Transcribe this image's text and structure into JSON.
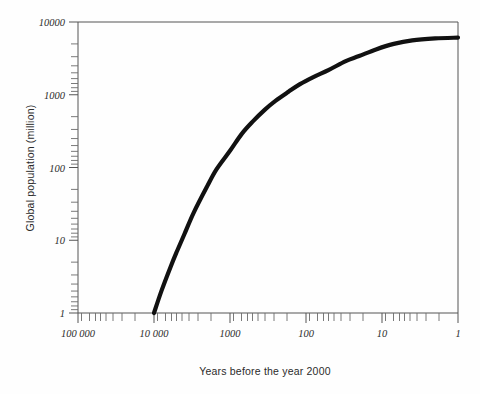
{
  "figure": {
    "background_color": "#fefefe",
    "curve_color": "#111111",
    "axis_color": "#555555"
  },
  "chart_data": {
    "type": "line",
    "title": "",
    "xlabel": "Years before the year 2000",
    "ylabel": "Global population (million)",
    "xscale": "log",
    "yscale": "log",
    "x_reversed": true,
    "xlim": [
      100000,
      1
    ],
    "ylim": [
      1,
      10000
    ],
    "grid": false,
    "legend": "none",
    "x_tick_labels": [
      "100 000",
      "10 000",
      "1000",
      "100",
      "10",
      "1"
    ],
    "x_tick_values": [
      100000,
      10000,
      1000,
      100,
      10,
      1
    ],
    "y_tick_labels": [
      "1",
      "10",
      "100",
      "1000",
      "10000"
    ],
    "y_tick_values": [
      1,
      10,
      100,
      1000,
      10000
    ],
    "minor_ticks": true,
    "series": [
      {
        "name": "Global population",
        "x": [
          10000,
          8000,
          6000,
          5000,
          4000,
          3000,
          2000,
          1500,
          1000,
          700,
          500,
          350,
          250,
          170,
          120,
          80,
          50,
          30,
          20,
          12,
          7,
          4,
          2,
          1
        ],
        "y": [
          1,
          2.0,
          4.4,
          7.0,
          12,
          24,
          55,
          95,
          170,
          290,
          430,
          620,
          830,
          1100,
          1400,
          1750,
          2200,
          2900,
          3400,
          4200,
          5000,
          5600,
          5950,
          6100
        ]
      }
    ],
    "annotations": []
  }
}
